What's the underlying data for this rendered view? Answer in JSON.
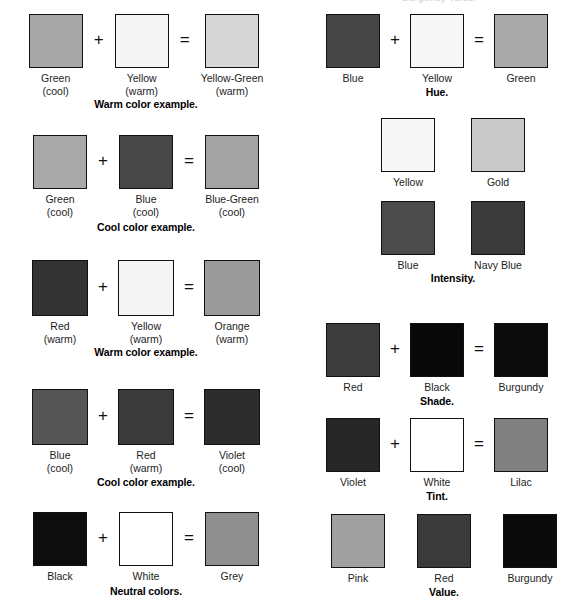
{
  "page": {
    "background": "#ffffff",
    "cropped_top_heading": "Burgundy Value."
  },
  "palette": {
    "green": "#a8a8a8",
    "yellow": "#f4f4f4",
    "yellow_green": "#d6d6d6",
    "green_mid": "#a9a9a9",
    "blue": "#474747",
    "blue_green": "#a3a3a3",
    "red": "#333333",
    "orange": "#9a9a9a",
    "blue_light": "#555555",
    "red_dark": "#3a3a3a",
    "violet": "#2c2c2c",
    "black": "#0d0d0d",
    "white": "#ffffff",
    "grey": "#8f8f8f",
    "hue_blue": "#464646",
    "hue_yellow": "#f6f6f6",
    "hue_green": "#aaaaaa",
    "int_yellow": "#f7f7f7",
    "int_gold": "#c9c9c9",
    "int_blue": "#4b4b4b",
    "int_navy": "#3a3a3a",
    "shade_red": "#3d3d3d",
    "shade_black": "#080808",
    "shade_burgundy": "#0c0c0c",
    "tint_violet": "#262626",
    "tint_white": "#ffffff",
    "tint_lilac": "#808080",
    "value_pink": "#a0a0a0",
    "value_red": "#3b3b3b",
    "value_burgundy": "#0a0a0a",
    "swatch_border": "#111111"
  },
  "operators": {
    "plus": "+",
    "equals": "="
  },
  "left_column": {
    "blocks": [
      {
        "name": "warm-color-example-1",
        "caption": "Warm color example.",
        "cells": [
          {
            "label": "Green",
            "sub": "(cool)",
            "color": "#a8a8a8",
            "name": "green"
          },
          {
            "label": "Yellow",
            "sub": "(warm)",
            "color": "#f4f4f4",
            "name": "yellow"
          },
          {
            "label": "Yellow-Green",
            "sub": "(warm)",
            "color": "#d6d6d6",
            "name": "yellow-green"
          }
        ]
      },
      {
        "name": "cool-color-example-1",
        "caption": "Cool color example.",
        "cells": [
          {
            "label": "Green",
            "sub": "(cool)",
            "color": "#a9a9a9",
            "name": "green"
          },
          {
            "label": "Blue",
            "sub": "(cool)",
            "color": "#474747",
            "name": "blue"
          },
          {
            "label": "Blue-Green",
            "sub": "(cool)",
            "color": "#a3a3a3",
            "name": "blue-green"
          }
        ]
      },
      {
        "name": "warm-color-example-2",
        "caption": "Warm color example.",
        "cells": [
          {
            "label": "Red",
            "sub": "(warm)",
            "color": "#333333",
            "name": "red"
          },
          {
            "label": "Yellow",
            "sub": "(warm)",
            "color": "#f4f4f4",
            "name": "yellow"
          },
          {
            "label": "Orange",
            "sub": "(warm)",
            "color": "#9a9a9a",
            "name": "orange"
          }
        ]
      },
      {
        "name": "cool-color-example-2",
        "caption": "Cool color example.",
        "cells": [
          {
            "label": "Blue",
            "sub": "(cool)",
            "color": "#555555",
            "name": "blue"
          },
          {
            "label": "Red",
            "sub": "(warm)",
            "color": "#3a3a3a",
            "name": "red"
          },
          {
            "label": "Violet",
            "sub": "(cool)",
            "color": "#2c2c2c",
            "name": "violet"
          }
        ]
      },
      {
        "name": "neutral-colors",
        "caption": "Neutral colors.",
        "cells": [
          {
            "label": "Black",
            "sub": "",
            "color": "#0d0d0d",
            "name": "black"
          },
          {
            "label": "White",
            "sub": "",
            "color": "#ffffff",
            "name": "white"
          },
          {
            "label": "Grey",
            "sub": "",
            "color": "#8f8f8f",
            "name": "grey"
          }
        ]
      }
    ]
  },
  "right_column": {
    "blocks": [
      {
        "name": "hue",
        "caption": "Hue.",
        "cells": [
          {
            "label": "Blue",
            "sub": "",
            "color": "#464646",
            "name": "blue"
          },
          {
            "label": "Yellow",
            "sub": "",
            "color": "#f6f6f6",
            "name": "yellow"
          },
          {
            "label": "Green",
            "sub": "",
            "color": "#aaaaaa",
            "name": "green"
          }
        ]
      },
      {
        "name": "intensity",
        "caption": "Intensity.",
        "pairs": [
          [
            {
              "label": "Yellow",
              "sub": "",
              "color": "#f7f7f7",
              "name": "yellow"
            },
            {
              "label": "Gold",
              "sub": "",
              "color": "#c9c9c9",
              "name": "gold"
            }
          ],
          [
            {
              "label": "Blue",
              "sub": "",
              "color": "#4b4b4b",
              "name": "blue"
            },
            {
              "label": "Navy Blue",
              "sub": "",
              "color": "#3a3a3a",
              "name": "navy-blue"
            }
          ]
        ]
      },
      {
        "name": "shade",
        "caption": "Shade.",
        "cells": [
          {
            "label": "Red",
            "sub": "",
            "color": "#3d3d3d",
            "name": "red"
          },
          {
            "label": "Black",
            "sub": "",
            "color": "#080808",
            "name": "black"
          },
          {
            "label": "Burgundy",
            "sub": "",
            "color": "#0c0c0c",
            "name": "burgundy"
          }
        ]
      },
      {
        "name": "tint",
        "caption": "Tint.",
        "cells": [
          {
            "label": "Violet",
            "sub": "",
            "color": "#262626",
            "name": "violet"
          },
          {
            "label": "White",
            "sub": "",
            "color": "#ffffff",
            "name": "white"
          },
          {
            "label": "Lilac",
            "sub": "",
            "color": "#808080",
            "name": "lilac"
          }
        ]
      },
      {
        "name": "value",
        "caption": "Value.",
        "cells": [
          {
            "label": "Pink",
            "sub": "",
            "color": "#a0a0a0",
            "name": "pink"
          },
          {
            "label": "Red",
            "sub": "",
            "color": "#3b3b3b",
            "name": "red"
          },
          {
            "label": "Burgundy",
            "sub": "",
            "color": "#0a0a0a",
            "name": "burgundy"
          }
        ]
      }
    ]
  }
}
